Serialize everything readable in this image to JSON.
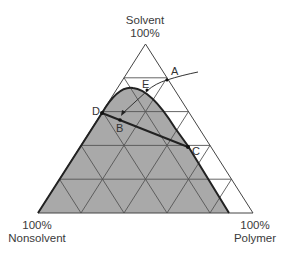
{
  "diagram": {
    "type": "ternary-phase-diagram",
    "vertices": {
      "top": {
        "name": "Solvent",
        "pct": "100%"
      },
      "bottom_left": {
        "pct": "100%",
        "name": "Nonsolvent"
      },
      "bottom_right": {
        "pct": "100%",
        "name": "Polymer"
      }
    },
    "grid_divisions": 5,
    "points": {
      "A": "A",
      "B": "B",
      "C": "C",
      "D": "D",
      "E": "E"
    },
    "colors": {
      "shaded_region": "#a9a9a9",
      "lines": "#333333",
      "grid": "#555555",
      "background": "#ffffff"
    },
    "annotations": [
      "Shaded two-phase region bounded by binodal curve",
      "Composition path from A through E to B",
      "Tie line from D through B to C"
    ]
  }
}
